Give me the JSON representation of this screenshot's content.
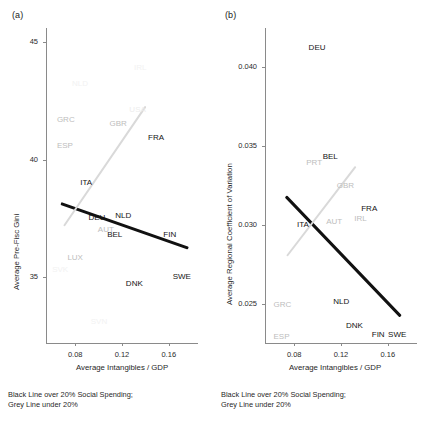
{
  "figure": {
    "caption_line1": "Black Line over 20% Social Spending;",
    "caption_line2": "Grey Line under 20%"
  },
  "chart_data": [
    {
      "type": "scatter",
      "panel": "(a)",
      "title": "",
      "xlabel": "Average Intangibles / GDP",
      "ylabel": "Average Pre-Fisc Gini",
      "xlim": [
        0.055,
        0.185
      ],
      "ylim": [
        32.2,
        45.6
      ],
      "xticks": [
        0.08,
        0.12,
        0.16
      ],
      "xticklabels": [
        "0.08",
        "0.12",
        "0.16"
      ],
      "yticks": [
        35,
        40,
        45
      ],
      "yticklabels": [
        "35",
        "40",
        "45"
      ],
      "grid": false,
      "legend": "none",
      "points": [
        {
          "label": "IRL",
          "x": 0.138,
          "y": 43.9,
          "style": "faint"
        },
        {
          "label": "NLD",
          "x": 0.085,
          "y": 43.2,
          "style": "faint"
        },
        {
          "label": "USA",
          "x": 0.134,
          "y": 42.1,
          "style": "faint2"
        },
        {
          "label": "GRC",
          "x": 0.072,
          "y": 41.7,
          "style": "grey"
        },
        {
          "label": "GBR",
          "x": 0.117,
          "y": 41.5,
          "style": "grey"
        },
        {
          "label": "FRA",
          "x": 0.15,
          "y": 40.9,
          "style": "dark"
        },
        {
          "label": "ESP",
          "x": 0.072,
          "y": 40.6,
          "style": "grey"
        },
        {
          "label": "ITA",
          "x": 0.092,
          "y": 39.0,
          "style": "dark"
        },
        {
          "label": "NLD",
          "x": 0.122,
          "y": 37.6,
          "style": "dark"
        },
        {
          "label": "DEU",
          "x": 0.099,
          "y": 37.5,
          "style": "dark"
        },
        {
          "label": "AUT",
          "x": 0.107,
          "y": 37.0,
          "style": "grey"
        },
        {
          "label": "BEL",
          "x": 0.115,
          "y": 36.8,
          "style": "dark"
        },
        {
          "label": "FIN",
          "x": 0.163,
          "y": 36.8,
          "style": "dark"
        },
        {
          "label": "LUX",
          "x": 0.081,
          "y": 35.8,
          "style": "grey"
        },
        {
          "label": "SVK",
          "x": 0.068,
          "y": 35.3,
          "style": "faint"
        },
        {
          "label": "SWE",
          "x": 0.171,
          "y": 35.0,
          "style": "dark"
        },
        {
          "label": "DNK",
          "x": 0.131,
          "y": 34.7,
          "style": "dark"
        },
        {
          "label": "SVN",
          "x": 0.101,
          "y": 33.1,
          "style": "faint"
        }
      ],
      "lines": [
        {
          "name": "black-trend",
          "color": "#111111",
          "x0": 0.068,
          "y0": 38.2,
          "x1": 0.177,
          "y1": 36.3,
          "note": "over 20% social spending"
        },
        {
          "name": "grey-trend",
          "color": "#d9d9d9",
          "x0": 0.07,
          "y0": 37.2,
          "x1": 0.14,
          "y1": 42.3,
          "note": "under 20% social spending"
        }
      ]
    },
    {
      "type": "scatter",
      "panel": "(b)",
      "title": "",
      "xlabel": "Average Intangibles / GDP",
      "ylabel": "Average Regional Coefficient of Variation",
      "xlim": [
        0.055,
        0.185
      ],
      "ylim": [
        0.0225,
        0.0425
      ],
      "xticks": [
        0.08,
        0.12,
        0.16
      ],
      "xticklabels": [
        "0.08",
        "0.12",
        "0.16"
      ],
      "yticks": [
        0.025,
        0.03,
        0.035,
        0.04
      ],
      "yticklabels": [
        "0.025",
        "0.030",
        "0.035",
        "0.040"
      ],
      "grid": false,
      "legend": "none",
      "points": [
        {
          "label": "DEU",
          "x": 0.1,
          "y": 0.0412,
          "style": "dark"
        },
        {
          "label": "BEL",
          "x": 0.112,
          "y": 0.0343,
          "style": "dark"
        },
        {
          "label": "PRT",
          "x": 0.098,
          "y": 0.0339,
          "style": "grey"
        },
        {
          "label": "GBR",
          "x": 0.124,
          "y": 0.0325,
          "style": "grey"
        },
        {
          "label": "FRA",
          "x": 0.145,
          "y": 0.031,
          "style": "dark"
        },
        {
          "label": "IRL",
          "x": 0.139,
          "y": 0.0304,
          "style": "grey"
        },
        {
          "label": "AUT",
          "x": 0.115,
          "y": 0.0302,
          "style": "grey"
        },
        {
          "label": "ITA",
          "x": 0.09,
          "y": 0.03,
          "style": "dark"
        },
        {
          "label": "NLD",
          "x": 0.121,
          "y": 0.0251,
          "style": "dark"
        },
        {
          "label": "GRC",
          "x": 0.07,
          "y": 0.0249,
          "style": "grey"
        },
        {
          "label": "DNK",
          "x": 0.132,
          "y": 0.0236,
          "style": "dark"
        },
        {
          "label": "SWE",
          "x": 0.168,
          "y": 0.023,
          "style": "dark"
        },
        {
          "label": "FIN",
          "x": 0.154,
          "y": 0.023,
          "style": "dark"
        },
        {
          "label": "ESP",
          "x": 0.07,
          "y": 0.0229,
          "style": "grey"
        }
      ],
      "lines": [
        {
          "name": "black-trend",
          "color": "#111111",
          "x0": 0.073,
          "y0": 0.0319,
          "x1": 0.171,
          "y1": 0.0243,
          "note": "over 20% social spending"
        },
        {
          "name": "grey-trend",
          "color": "#d9d9d9",
          "x0": 0.074,
          "y0": 0.0281,
          "x1": 0.133,
          "y1": 0.0338,
          "note": "under 20% social spending"
        }
      ]
    }
  ]
}
